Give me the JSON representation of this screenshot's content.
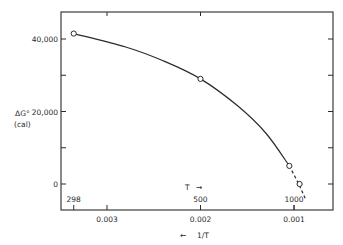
{
  "chart_data": {
    "type": "line",
    "title": "",
    "ylabel": "ΔG°",
    "ylabel_unit": "(cal)",
    "xlabel": "1/T",
    "xlabel_arrow": "←",
    "secondary_xlabel": "T",
    "secondary_xlabel_arrow": "→",
    "ylim": [
      -7000,
      48000
    ],
    "xlim": [
      0.00355,
      0.00065
    ],
    "y_ticks": [
      0,
      10000,
      20000,
      30000,
      40000
    ],
    "y_tick_labels": [
      "0",
      "",
      "20,000",
      "",
      "40,000"
    ],
    "x_ticks": [
      0.003,
      0.002,
      0.001
    ],
    "x_tick_labels": [
      "0.003",
      "0.002",
      "0.001"
    ],
    "secondary_x_ticks": [
      298,
      500,
      1000
    ],
    "secondary_x_tick_labels": [
      "298",
      "500",
      "1000"
    ],
    "grid": false,
    "series": [
      {
        "name": "ΔG° curve (solid)",
        "style": "solid",
        "x": [
          0.003356,
          0.0028,
          0.0024,
          0.002,
          0.0016,
          0.0013,
          0.00105
        ],
        "y": [
          41500,
          37800,
          34000,
          29000,
          21500,
          14000,
          5000
        ]
      },
      {
        "name": "ΔG° extrapolation (dashed)",
        "style": "dashed",
        "x": [
          0.00105,
          0.00095,
          0.00088
        ],
        "y": [
          5000,
          0,
          -4000
        ]
      }
    ],
    "markers": {
      "style": "open-circle",
      "x": [
        0.003356,
        0.002,
        0.00105,
        0.00094
      ],
      "y": [
        41500,
        29000,
        5000,
        0
      ]
    }
  }
}
